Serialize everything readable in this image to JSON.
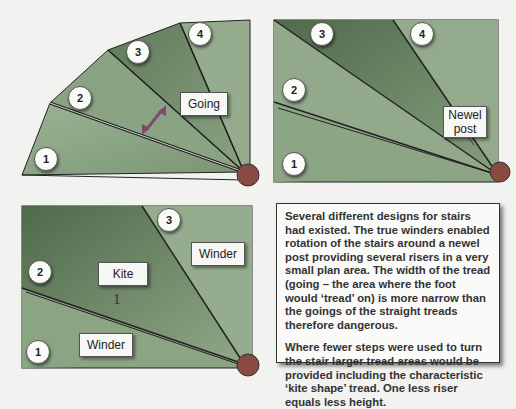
{
  "colors": {
    "background": "#f2f2f0",
    "tread_light": "#8fa88a",
    "tread_mid": "#7d9878",
    "tread_dark": "#5a7256",
    "newel_post": "#8a4a42",
    "going_arrow": "#7b4d6d",
    "line": "#222222"
  },
  "diagrams": [
    {
      "name": "fan-winders",
      "numbers": [
        "1",
        "2",
        "3",
        "4"
      ],
      "labels": {
        "going": "Going"
      }
    },
    {
      "name": "rectangular-winders",
      "numbers": [
        "1",
        "2",
        "3",
        "4"
      ],
      "labels": {
        "newel_line1": "Newel",
        "newel_line2": "post"
      }
    },
    {
      "name": "kite-winders",
      "numbers": [
        "1",
        "2",
        "3"
      ],
      "labels": {
        "kite": "Kite",
        "winder_upper": "Winder",
        "winder_lower": "Winder",
        "marker": "1"
      }
    }
  ],
  "description": {
    "paragraph1": "Several different designs for stairs had existed. The true winders enabled rotation of the stairs around a newel post providing several risers in a very small plan area. The width of the tread (going – the area where the foot would ‘tread’ on) is more narrow than the goings of the straight treads therefore dangerous.",
    "paragraph2": "Where fewer steps were used to turn the stair larger tread areas would be provided including the characteristic ‘kite shape’ tread. One less riser equals less height."
  }
}
